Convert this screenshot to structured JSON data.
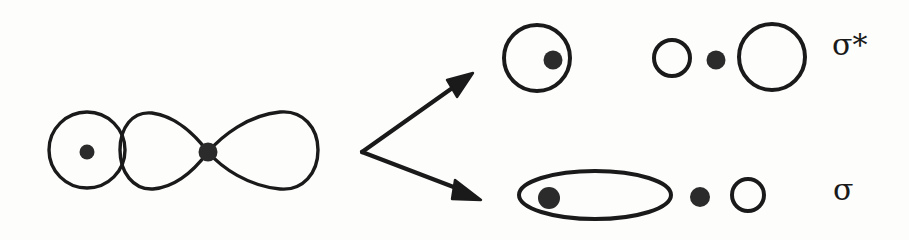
{
  "figure": {
    "background_color": "#fdfdfc",
    "ink_color": "#1a1a1a",
    "stroke_width": 3.2
  },
  "reactant": {
    "name": "s-orbital overlapping p-orbital",
    "s_orbital": {
      "shape": "circle",
      "cx": 87,
      "cy": 150,
      "r": 38,
      "nucleus": {
        "cx": 87,
        "cy": 152,
        "r": 7
      }
    },
    "p_orbital": {
      "shape": "two-lobe",
      "nucleus": {
        "cx": 208,
        "cy": 152,
        "r": 9
      },
      "left_lobe_tip_x": 208,
      "left_lobe_far_x": 122,
      "right_lobe_tip_x": 208,
      "right_lobe_far_x": 318,
      "lobe_half_height": 36
    }
  },
  "arrows": {
    "origin": {
      "x": 362,
      "y": 152
    },
    "upper": {
      "tip_x": 472,
      "tip_y": 74,
      "label": "leads-to-antibonding"
    },
    "lower": {
      "tip_x": 480,
      "tip_y": 199,
      "label": "leads-to-bonding"
    }
  },
  "products": [
    {
      "id": "antibonding",
      "label": "σ*",
      "label_name": "sigma-star",
      "row_y": 58,
      "shapes": [
        {
          "type": "circle",
          "cx": 537,
          "cy": 58,
          "r": 33,
          "filled": false
        },
        {
          "type": "dot",
          "cx": 553,
          "cy": 60,
          "r": 9
        },
        {
          "type": "circle",
          "cx": 672,
          "cy": 58,
          "r": 18,
          "filled": false
        },
        {
          "type": "dot",
          "cx": 716,
          "cy": 60,
          "r": 9
        },
        {
          "type": "circle",
          "cx": 772,
          "cy": 57,
          "r": 33,
          "filled": false
        }
      ]
    },
    {
      "id": "bonding",
      "label": "σ",
      "label_name": "sigma",
      "row_y": 195,
      "shapes": [
        {
          "type": "ellipse",
          "cx": 595,
          "cy": 195,
          "rx": 76,
          "ry": 24,
          "filled": false
        },
        {
          "type": "dot",
          "cx": 549,
          "cy": 198,
          "r": 11
        },
        {
          "type": "dot",
          "cx": 700,
          "cy": 197,
          "r": 10
        },
        {
          "type": "circle",
          "cx": 748,
          "cy": 195,
          "r": 16,
          "filled": false
        }
      ]
    }
  ]
}
